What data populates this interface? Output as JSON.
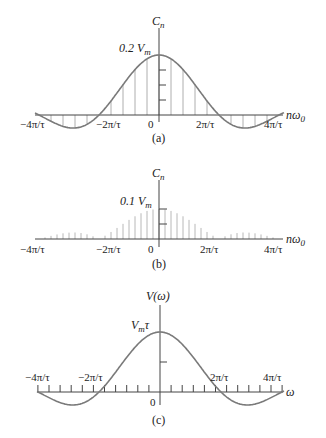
{
  "figure": {
    "panels": [
      {
        "id": "a",
        "caption": "(a)",
        "y_label": "C",
        "y_label_sub": "n",
        "peak_label": "0.2 V",
        "peak_label_sub": "m",
        "x_label": "nω",
        "x_label_sub": "0",
        "tick_labels": [
          "−4π/τ",
          "−2π/τ",
          "0",
          "2π/τ",
          "4π/τ"
        ],
        "line_spacing_fraction_of_2pi_over_tau": 0.2
      },
      {
        "id": "b",
        "caption": "(b)",
        "y_label": "C",
        "y_label_sub": "n",
        "peak_label": "0.1 V",
        "peak_label_sub": "m",
        "x_label": "nω",
        "x_label_sub": "0",
        "tick_labels": [
          "−4π/τ",
          "−2π/τ",
          "0",
          "2π/τ",
          "4π/τ"
        ],
        "line_spacing_fraction_of_2pi_over_tau": 0.1
      },
      {
        "id": "c",
        "caption": "(c)",
        "y_label": "V(ω)",
        "peak_label": "V",
        "peak_label_sub": "m",
        "peak_label_suffix": "τ",
        "x_label": "ω",
        "tick_labels": [
          "−4π/τ",
          "−2π/τ",
          "0",
          "2π/τ",
          "4π/τ"
        ]
      }
    ]
  },
  "chart_data": [
    {
      "type": "bar",
      "title": "(a) Line spectrum, duty cycle 0.2",
      "xlabel": "nω0",
      "ylabel": "Cn",
      "x_ticks": [
        "−4π/τ",
        "−2π/τ",
        "0",
        "2π/τ",
        "4π/τ"
      ],
      "peak": "0.2 Vm",
      "envelope": "sinc",
      "zero_crossings": [
        "−2π/τ",
        "2π/τ"
      ],
      "lines_per_2pi_over_tau": 5
    },
    {
      "type": "bar",
      "title": "(b) Line spectrum, duty cycle 0.1",
      "xlabel": "nω0",
      "ylabel": "Cn",
      "x_ticks": [
        "−4π/τ",
        "−2π/τ",
        "0",
        "2π/τ",
        "4π/τ"
      ],
      "peak": "0.1 Vm",
      "envelope": "sinc",
      "zero_crossings": [
        "−2π/τ",
        "2π/τ"
      ],
      "lines_per_2pi_over_tau": 10
    },
    {
      "type": "line",
      "title": "(c) Continuous spectrum",
      "xlabel": "ω",
      "ylabel": "V(ω)",
      "x_ticks": [
        "−4π/τ",
        "−2π/τ",
        "0",
        "2π/τ",
        "4π/τ"
      ],
      "peak": "Vmτ",
      "function": "Vmτ · sin(ωτ/2)/(ωτ/2)",
      "zero_crossings": [
        "−2π/τ",
        "2π/τ",
        "−4π/τ",
        "4π/τ"
      ]
    }
  ]
}
